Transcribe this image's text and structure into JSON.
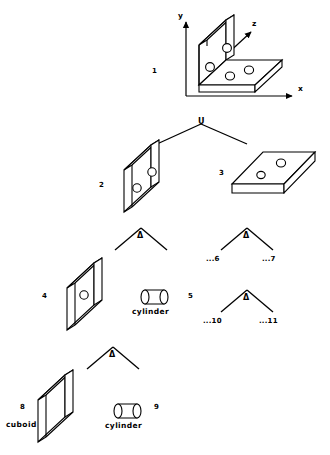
{
  "diagram": {
    "title_present": false,
    "type": "csg-tree",
    "stroke_color": "#000000",
    "fill_color": "#ffffff",
    "background": "#ffffff"
  },
  "axes": {
    "y_label": "y",
    "x_label": "x",
    "z_label": "z"
  },
  "operators": {
    "union": "U",
    "difference": "Δ"
  },
  "nodes": {
    "root": {
      "number": "1",
      "shape": "l-bracket-with-holes"
    },
    "left_child": {
      "number": "2",
      "shape": "vertical-plate-two-holes"
    },
    "right_child": {
      "number": "3",
      "shape": "horizontal-plate-two-holes"
    },
    "n4": {
      "number": "4",
      "shape": "vertical-plate-one-hole"
    },
    "n5": {
      "number": "5",
      "shape": "cylinder",
      "name": "cylinder"
    },
    "n6": {
      "number": "...6"
    },
    "n7": {
      "number": "...7"
    },
    "n8": {
      "number": "8",
      "shape": "cuboid",
      "name": "cuboid"
    },
    "n9": {
      "number": "9",
      "shape": "cylinder",
      "name": "cylinder"
    },
    "n10": {
      "number": "...10"
    },
    "n11": {
      "number": "...11"
    }
  }
}
